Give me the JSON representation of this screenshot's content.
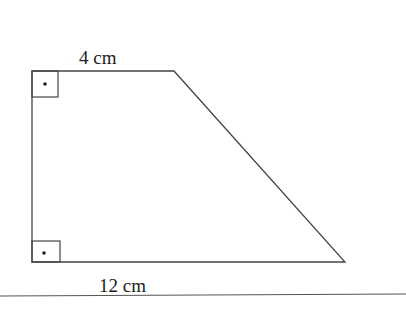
{
  "figure": {
    "shape": "right trapezoid",
    "labels": {
      "top": "4 cm",
      "bottom": "12 cm"
    },
    "right_angle_markers": 2,
    "colors": {
      "stroke": "#444444",
      "background": "#ffffff"
    }
  }
}
